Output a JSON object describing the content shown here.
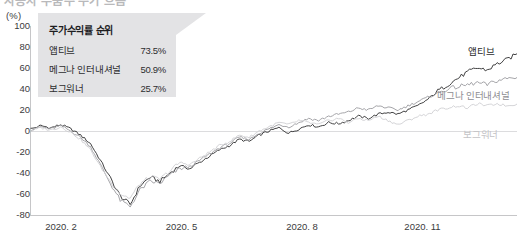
{
  "header": {
    "clipped_title": "자동차 부품주 주가 흐름"
  },
  "legend": {
    "title": "주가수익률 순위",
    "rows": [
      {
        "name": "앱티브",
        "value": "73.5%"
      },
      {
        "name": "메그나 인터내셔널",
        "value": "50.9%"
      },
      {
        "name": "보그워너",
        "value": "25.7%"
      }
    ]
  },
  "series_labels": {
    "aptiv": "앱티브",
    "magna": "메그나 인터내셔널",
    "borgwarner": "보그워너"
  },
  "colors": {
    "aptiv": "#2b2b2d",
    "magna": "#9a9a9e",
    "borgwarner": "#cfcfd2",
    "legend_bg": "#e3e3e5",
    "axis": "#c6c6c8",
    "zero_line": "#dcdcde"
  },
  "chart_data": {
    "type": "line",
    "title": "주가수익률 순위",
    "xlabel": "",
    "ylabel": "(%)",
    "unit": "(%)",
    "ylim": [
      -80,
      100
    ],
    "yticks": [
      100,
      80,
      60,
      40,
      20,
      0,
      -20,
      -40,
      -60,
      -80
    ],
    "xticks": [
      "2020. 2",
      "2020. 5",
      "2020. 8",
      "2020. 11",
      "2021. 2"
    ],
    "grid": false,
    "legend_position": "inline-right",
    "x": [
      "2020.2",
      "2020.2",
      "2020.2",
      "2020.2",
      "2020.3",
      "2020.3",
      "2020.3",
      "2020.3",
      "2020.4",
      "2020.4",
      "2020.4",
      "2020.4",
      "2020.5",
      "2020.5",
      "2020.5",
      "2020.5",
      "2020.6",
      "2020.6",
      "2020.6",
      "2020.6",
      "2020.7",
      "2020.7",
      "2020.7",
      "2020.7",
      "2020.8",
      "2020.8",
      "2020.8",
      "2020.8",
      "2020.9",
      "2020.9",
      "2020.9",
      "2020.9",
      "2020.10",
      "2020.10",
      "2020.10",
      "2020.10",
      "2020.11",
      "2020.11",
      "2020.11",
      "2020.11",
      "2020.12",
      "2020.12",
      "2020.12",
      "2020.12",
      "2021.1",
      "2021.1",
      "2021.1",
      "2021.1",
      "2021.2",
      "2021.2"
    ],
    "series": [
      {
        "name": "앱티브",
        "color": "#2b2b2d",
        "final_value": 73.5,
        "values": [
          2,
          5,
          3,
          6,
          2,
          -4,
          -12,
          -28,
          -45,
          -62,
          -70,
          -52,
          -44,
          -48,
          -40,
          -33,
          -36,
          -30,
          -24,
          -18,
          -14,
          -8,
          -10,
          -4,
          0,
          3,
          -2,
          2,
          6,
          4,
          8,
          7,
          10,
          14,
          12,
          16,
          18,
          16,
          20,
          24,
          30,
          38,
          44,
          50,
          56,
          60,
          58,
          64,
          68,
          73.5
        ]
      },
      {
        "name": "메그나 인터내셔널",
        "color": "#9a9a9e",
        "final_value": 50.9,
        "values": [
          1,
          4,
          2,
          5,
          0,
          -6,
          -15,
          -32,
          -50,
          -66,
          -72,
          -56,
          -48,
          -50,
          -42,
          -36,
          -34,
          -28,
          -22,
          -16,
          -12,
          -6,
          -8,
          -2,
          2,
          6,
          4,
          8,
          12,
          10,
          14,
          16,
          18,
          22,
          20,
          24,
          22,
          20,
          24,
          28,
          32,
          36,
          40,
          42,
          44,
          46,
          44,
          48,
          50,
          50.9
        ]
      },
      {
        "name": "보그워너",
        "color": "#cfcfd2",
        "final_value": 25.7,
        "values": [
          0,
          3,
          1,
          4,
          -1,
          -8,
          -18,
          -34,
          -48,
          -60,
          -64,
          -50,
          -44,
          -46,
          -38,
          -30,
          -32,
          -26,
          -20,
          -14,
          -10,
          -4,
          -6,
          0,
          4,
          8,
          6,
          10,
          8,
          6,
          10,
          12,
          8,
          12,
          10,
          14,
          10,
          6,
          10,
          14,
          16,
          20,
          22,
          24,
          22,
          26,
          24,
          26,
          24,
          25.7
        ]
      }
    ]
  }
}
